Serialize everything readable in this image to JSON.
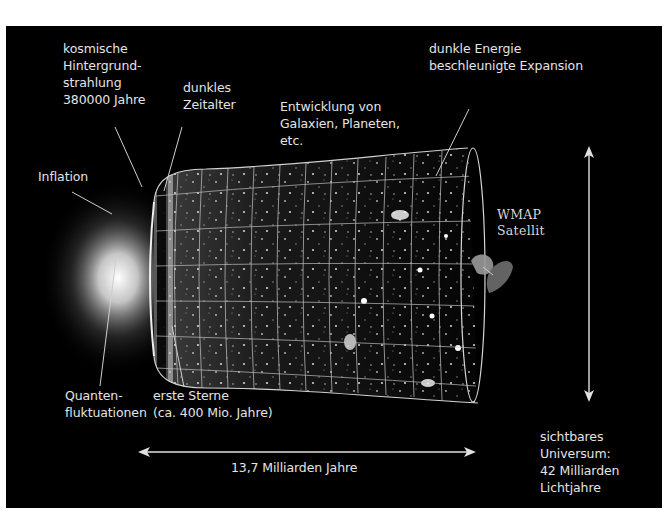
{
  "diagram": {
    "background": "#000000",
    "text_color": "#e4e4e4",
    "labels": {
      "cmb": [
        "kosmische",
        "Hintergrund-",
        "strahlung",
        "380000 Jahre"
      ],
      "dark_age": [
        "dunkles",
        "Zeitalter"
      ],
      "inflation": [
        "Inflation"
      ],
      "galaxies": [
        "Entwicklung von",
        "Galaxien, Planeten,",
        "etc."
      ],
      "dark_energy": [
        "dunkle Energie",
        "beschleunigte Expansion"
      ],
      "wmap": [
        "WMAP",
        "Satellit"
      ],
      "quantum": [
        "Quanten-",
        "fluktuationen"
      ],
      "first_stars": [
        "erste Sterne",
        "(ca. 400 Mio. Jahre)"
      ],
      "time_span": [
        "13,7 Milliarden Jahre"
      ],
      "observable": [
        "sichtbares",
        "Universum:",
        "42 Milliarden",
        "Lichtjahre"
      ]
    },
    "arrows": {
      "horizontal": {
        "label": "13,7 Milliarden Jahre",
        "direction": "both"
      },
      "vertical": {
        "label": "sichtbares Universum: 42 Milliarden Lichtjahre",
        "direction": "both"
      }
    },
    "icons": [
      "big-bang-glow",
      "universe-cone",
      "wmap-satellite"
    ]
  }
}
